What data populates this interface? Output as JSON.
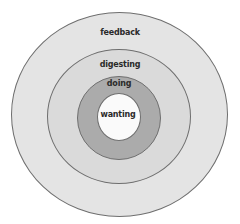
{
  "diagram": {
    "type": "concentric-circles",
    "rings": [
      {
        "label": "feedback",
        "fill": "#e4e4e4",
        "left": 11,
        "top": 12,
        "width": 217,
        "height": 205,
        "label_x": 120,
        "label_y": 32
      },
      {
        "label": "digesting",
        "fill": "#dadada",
        "left": 47,
        "top": 49,
        "width": 144,
        "height": 135,
        "label_x": 120,
        "label_y": 64
      },
      {
        "label": "doing",
        "fill": "#ababab",
        "left": 77,
        "top": 76,
        "width": 84,
        "height": 84,
        "label_x": 119,
        "label_y": 83
      },
      {
        "label": "wanting",
        "fill": "#fafafa",
        "left": 97,
        "top": 93,
        "width": 44,
        "height": 48,
        "label_x": 118,
        "label_y": 114
      }
    ]
  }
}
